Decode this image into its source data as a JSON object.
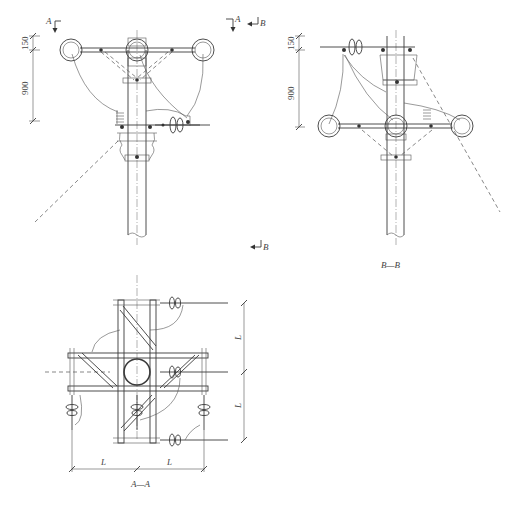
{
  "drawing": {
    "type": "engineering-drawing",
    "subject": "pole-mounted three-phase crossarm assembly with insulators",
    "colors": {
      "line": "#3a3a3a",
      "background": "#ffffff"
    }
  },
  "views": {
    "front": {
      "section_marks": {
        "a_left": "A",
        "a_right": "A",
        "b_top": "B",
        "b_bottom": "B"
      },
      "dimensions": {
        "top": "150",
        "main": "900"
      }
    },
    "side": {
      "title": "B—B",
      "dimensions": {
        "top": "150",
        "main": "900"
      }
    },
    "plan": {
      "title": "A—A",
      "dimensions": {
        "horizontal_left": "L",
        "horizontal_right": "L",
        "vertical_top": "L",
        "vertical_bottom": "L"
      }
    }
  }
}
